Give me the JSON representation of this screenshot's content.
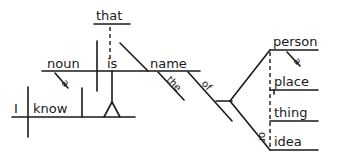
{
  "diagram": {
    "type": "sentence-diagram",
    "sentence": "I know that a noun is the name of a person, place, thing, or idea",
    "words": {
      "subject_main": "I",
      "verb_main": "know",
      "conjunction": "that",
      "subject_clause": "noun",
      "article_noun": "a",
      "linking_verb": "is",
      "predicate_noun": "name",
      "article_name": "the",
      "preposition": "of",
      "object_1": "person",
      "article_person": "a",
      "object_2": "place",
      "object_3": "thing",
      "conjunction_or": "or",
      "object_4": "idea"
    },
    "colors": {
      "ink": "#1a1a1a",
      "background": "#ffffff"
    }
  }
}
